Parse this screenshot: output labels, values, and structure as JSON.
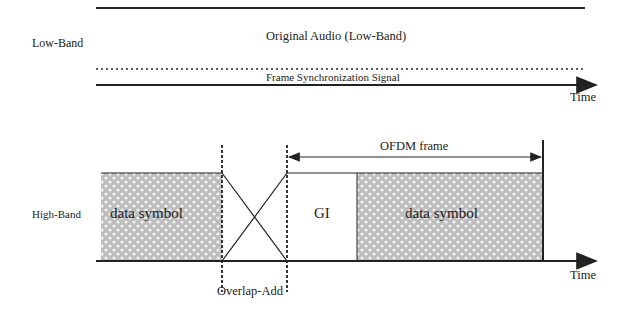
{
  "low_band": {
    "label": "Low-Band",
    "audio_label": "Original Audio (Low-Band)",
    "sync_label": "Frame Synchronization Signal",
    "time_label": "Time"
  },
  "high_band": {
    "label": "High-Band",
    "data_symbol_left": "data symbol",
    "gi_label": "GI",
    "data_symbol_right": "data symbol",
    "ofdm_frame_label": "OFDM frame",
    "overlap_add_label": "Overlap-Add",
    "time_label": "Time"
  },
  "colors": {
    "line": "#222222",
    "hatch_fill": "#c8c8c8"
  }
}
